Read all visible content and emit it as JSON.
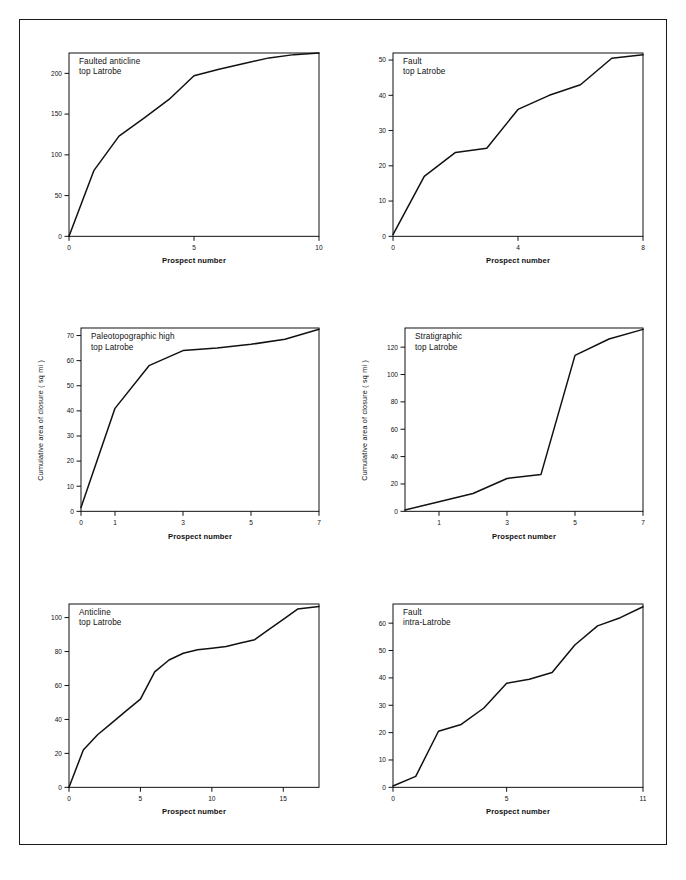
{
  "figure": {
    "background": "#ffffff",
    "line_color": "#111111",
    "frame": true,
    "xlabel_common": "Prospect number",
    "ylabel_common": "Cumulative area of closure ( sq mi )"
  },
  "chart_data": [
    {
      "id": "faulted-anticline-top-latrobe",
      "type": "line",
      "title": "Faulted anticline\ntop Latrobe",
      "title_lines": [
        "Faulted anticline",
        "top Latrobe"
      ],
      "xlabel": "Prospect number",
      "ylabel": "",
      "xlim": [
        0,
        10
      ],
      "ylim": [
        0,
        225
      ],
      "xticks": [
        0,
        5,
        10
      ],
      "xticklabels": [
        "0",
        "5",
        "10"
      ],
      "yticks": [
        0,
        50,
        100,
        150,
        200
      ],
      "yticklabels": [
        "0",
        "50",
        "100",
        "150",
        "200"
      ],
      "grid": false,
      "legend": "none",
      "x": [
        0,
        1,
        2,
        3,
        4,
        5,
        6,
        7,
        8,
        9,
        10
      ],
      "values": [
        0,
        81,
        123,
        145,
        168,
        197,
        205,
        212,
        219,
        223,
        225
      ]
    },
    {
      "id": "fault-top-latrobe",
      "type": "line",
      "title": "Fault\ntop Latrobe",
      "title_lines": [
        "Fault",
        "top Latrobe"
      ],
      "xlabel": "Prospect number",
      "ylabel": "",
      "xlim": [
        0,
        8
      ],
      "ylim": [
        0,
        52
      ],
      "xticks": [
        0,
        4,
        8
      ],
      "xticklabels": [
        "0",
        "4",
        "8"
      ],
      "yticks": [
        0,
        10,
        20,
        30,
        40,
        50
      ],
      "yticklabels": [
        "0",
        "10",
        "20",
        "30",
        "40",
        "50"
      ],
      "grid": false,
      "legend": "none",
      "x": [
        0,
        1,
        2,
        3,
        4,
        5,
        6,
        7,
        8
      ],
      "values": [
        0.5,
        17,
        23.8,
        25,
        36,
        40,
        43,
        50.5,
        51.5
      ]
    },
    {
      "id": "paleotopographic-high-top-latrobe",
      "type": "line",
      "title": "Paleotopographic high\ntop Latrobe",
      "title_lines": [
        "Paleotopographic high",
        "top Latrobe"
      ],
      "xlabel": "Prospect number",
      "ylabel": "Cumulative area of closure ( sq mi )",
      "xlim": [
        0,
        7
      ],
      "ylim": [
        0,
        73
      ],
      "xticks": [
        0,
        1,
        3,
        5,
        7
      ],
      "xticklabels": [
        "0",
        "1",
        "3",
        "5",
        "7"
      ],
      "yticks": [
        0,
        10,
        20,
        30,
        40,
        50,
        60,
        70
      ],
      "yticklabels": [
        "0",
        "10",
        "20",
        "30",
        "40",
        "50",
        "60",
        "70"
      ],
      "grid": false,
      "legend": "none",
      "x": [
        0,
        1,
        2,
        3,
        4,
        5,
        6,
        7
      ],
      "values": [
        1.5,
        41,
        58,
        64,
        65,
        66.5,
        68.5,
        72.5
      ]
    },
    {
      "id": "stratigraphic-top-latrobe",
      "type": "line",
      "title": "Stratigraphic\ntop Latrobe",
      "title_lines": [
        "Stratigraphic",
        "top Latrobe"
      ],
      "xlabel": "Prospect number",
      "ylabel": "Cumulative area of closure ( sq mi )",
      "xlim": [
        0,
        7
      ],
      "ylim": [
        0,
        134
      ],
      "xticks": [
        1,
        3,
        5,
        7
      ],
      "xticklabels": [
        "1",
        "3",
        "5",
        "7"
      ],
      "yticks": [
        0,
        20,
        40,
        60,
        80,
        100,
        120
      ],
      "yticklabels": [
        "0",
        "20",
        "40",
        "60",
        "80",
        "100",
        "120"
      ],
      "grid": false,
      "legend": "none",
      "x": [
        0,
        1,
        2,
        3,
        4,
        5,
        6,
        7
      ],
      "values": [
        1,
        7,
        13,
        24,
        27,
        114,
        126,
        133
      ]
    },
    {
      "id": "anticline-top-latrobe",
      "type": "line",
      "title": "Anticline\ntop Latrobe",
      "title_lines": [
        "Anticline",
        "top Latrobe"
      ],
      "xlabel": "Prospect number",
      "ylabel": "",
      "xlim": [
        0,
        17.5
      ],
      "ylim": [
        0,
        108
      ],
      "xticks": [
        0,
        5,
        10,
        15
      ],
      "xticklabels": [
        "0",
        "5",
        "10",
        "15"
      ],
      "yticks": [
        0,
        20,
        40,
        60,
        80,
        100
      ],
      "yticklabels": [
        "0",
        "20",
        "40",
        "60",
        "80",
        "100"
      ],
      "grid": false,
      "legend": "none",
      "x": [
        0,
        1,
        2,
        3,
        4,
        5,
        6,
        7,
        8,
        9,
        10,
        11,
        12,
        13,
        14,
        15,
        16,
        17.5
      ],
      "values": [
        0,
        22,
        31,
        38,
        45,
        52,
        68,
        75,
        79,
        81,
        82,
        83,
        85,
        87,
        93,
        99,
        105,
        106.5
      ]
    },
    {
      "id": "fault-intra-latrobe",
      "type": "line",
      "title": "Fault\nintra-Latrobe",
      "title_lines": [
        "Fault",
        "intra-Latrobe"
      ],
      "xlabel": "Prospect number",
      "ylabel": "",
      "xlim": [
        0,
        11
      ],
      "ylim": [
        0,
        67
      ],
      "xticks": [
        0,
        5,
        11
      ],
      "xticklabels": [
        "0",
        "5",
        "11"
      ],
      "yticks": [
        0,
        10,
        20,
        30,
        40,
        50,
        60
      ],
      "yticklabels": [
        "0",
        "10",
        "20",
        "30",
        "40",
        "50",
        "60"
      ],
      "grid": false,
      "legend": "none",
      "x": [
        0,
        1,
        2,
        3,
        4,
        5,
        6,
        7,
        8,
        9,
        10,
        11
      ],
      "values": [
        0.5,
        4,
        20.5,
        23,
        29,
        38,
        39.5,
        42,
        52,
        59,
        62,
        66
      ]
    }
  ]
}
